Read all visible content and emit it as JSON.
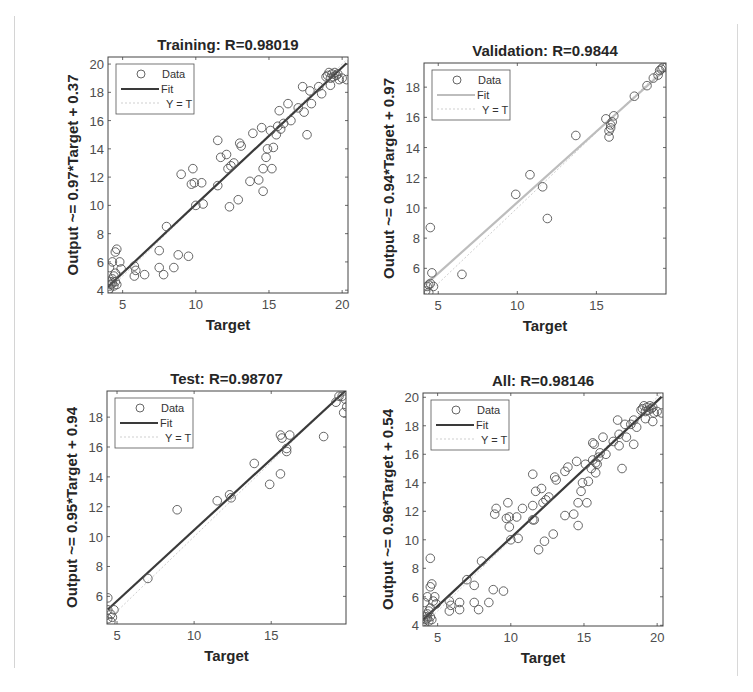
{
  "figure": {
    "legend": {
      "data_label": "Data",
      "fit_label": "Fit",
      "yt_label": "Y = T"
    },
    "colors": {
      "fit_dark": "#3a3a3a",
      "fit_light": "#bdbdbd",
      "yt": "#cfcfcf",
      "points": "#555555"
    }
  },
  "chart_data": [
    {
      "type": "scatter",
      "title": "Training: R=0.98019",
      "xlabel": "Target",
      "ylabel": "Output ~= 0.97*Target + 0.37",
      "xlim": [
        4,
        20.4
      ],
      "ylim": [
        3.8,
        20.5
      ],
      "xticks": [
        5,
        10,
        15,
        20
      ],
      "yticks": [
        4,
        6,
        8,
        10,
        12,
        14,
        16,
        18,
        20
      ],
      "fit": {
        "slope": 0.97,
        "intercept": 0.37,
        "color": "#3a3a3a"
      },
      "R": 0.98019,
      "points": [
        [
          4.1,
          4.1
        ],
        [
          4.2,
          4.4
        ],
        [
          4.3,
          4.5
        ],
        [
          4.4,
          4.3
        ],
        [
          4.5,
          4.6
        ],
        [
          4.3,
          4.8
        ],
        [
          4.4,
          5.0
        ],
        [
          4.5,
          5.2
        ],
        [
          4.2,
          4.6
        ],
        [
          4.6,
          4.4
        ],
        [
          4.1,
          5.6
        ],
        [
          4.3,
          6.0
        ],
        [
          4.5,
          6.7
        ],
        [
          4.6,
          6.9
        ],
        [
          4.8,
          6.0
        ],
        [
          4.9,
          5.5
        ],
        [
          4.0,
          3.9
        ],
        [
          5.8,
          5.7
        ],
        [
          5.8,
          5.0
        ],
        [
          5.9,
          5.4
        ],
        [
          6.5,
          5.1
        ],
        [
          7.5,
          6.8
        ],
        [
          7.5,
          5.6
        ],
        [
          7.8,
          5.1
        ],
        [
          8.0,
          8.5
        ],
        [
          8.5,
          5.6
        ],
        [
          8.8,
          6.5
        ],
        [
          9.0,
          12.2
        ],
        [
          9.5,
          6.4
        ],
        [
          9.7,
          11.5
        ],
        [
          9.8,
          12.6
        ],
        [
          9.9,
          11.6
        ],
        [
          10.0,
          10.0
        ],
        [
          10.4,
          11.6
        ],
        [
          10.5,
          10.1
        ],
        [
          11.5,
          11.4
        ],
        [
          11.5,
          14.6
        ],
        [
          11.7,
          13.4
        ],
        [
          12.1,
          13.6
        ],
        [
          12.2,
          12.6
        ],
        [
          12.3,
          9.9
        ],
        [
          12.4,
          12.8
        ],
        [
          12.6,
          13.0
        ],
        [
          12.9,
          10.4
        ],
        [
          13.0,
          14.4
        ],
        [
          13.1,
          14.2
        ],
        [
          13.7,
          11.7
        ],
        [
          13.9,
          15.1
        ],
        [
          14.3,
          11.8
        ],
        [
          14.5,
          15.5
        ],
        [
          14.6,
          12.6
        ],
        [
          14.6,
          11.0
        ],
        [
          14.8,
          13.4
        ],
        [
          14.9,
          14.0
        ],
        [
          15.1,
          15.3
        ],
        [
          15.2,
          12.6
        ],
        [
          15.3,
          14.1
        ],
        [
          15.5,
          15.0
        ],
        [
          15.6,
          15.6
        ],
        [
          15.7,
          16.7
        ],
        [
          15.8,
          15.4
        ],
        [
          16.0,
          15.8
        ],
        [
          16.3,
          17.2
        ],
        [
          16.5,
          16.0
        ],
        [
          17.0,
          16.9
        ],
        [
          17.3,
          18.4
        ],
        [
          17.4,
          16.6
        ],
        [
          17.6,
          15.0
        ],
        [
          17.8,
          18.1
        ],
        [
          17.9,
          17.2
        ],
        [
          18.4,
          18.4
        ],
        [
          18.6,
          17.9
        ],
        [
          18.9,
          19.1
        ],
        [
          19.0,
          19.2
        ],
        [
          19.1,
          19.4
        ],
        [
          19.2,
          19.0
        ],
        [
          19.3,
          19.3
        ],
        [
          19.4,
          19.1
        ],
        [
          19.5,
          19.4
        ],
        [
          19.6,
          19.2
        ],
        [
          19.7,
          19.3
        ],
        [
          19.8,
          18.9
        ],
        [
          20.0,
          19.0
        ],
        [
          20.3,
          18.9
        ],
        [
          19.2,
          18.5
        ]
      ]
    },
    {
      "type": "scatter",
      "title": "Validation: R=0.9844",
      "xlabel": "Target",
      "ylabel": "Output ~= 0.94*Target + 0.97",
      "xlim": [
        4.1,
        19.4
      ],
      "ylim": [
        4.3,
        19.6
      ],
      "xticks": [
        5,
        10,
        15
      ],
      "yticks": [
        6,
        8,
        10,
        12,
        14,
        16,
        18
      ],
      "fit": {
        "slope": 0.94,
        "intercept": 0.97,
        "color": "#bdbdbd"
      },
      "R": 0.9844,
      "points": [
        [
          4.2,
          4.5
        ],
        [
          4.3,
          4.8
        ],
        [
          4.4,
          4.9
        ],
        [
          4.5,
          5.0
        ],
        [
          4.4,
          4.4
        ],
        [
          4.7,
          4.8
        ],
        [
          4.6,
          5.7
        ],
        [
          4.5,
          8.7
        ],
        [
          6.5,
          5.6
        ],
        [
          9.9,
          10.9
        ],
        [
          10.8,
          12.2
        ],
        [
          11.6,
          11.4
        ],
        [
          11.9,
          9.3
        ],
        [
          13.7,
          14.8
        ],
        [
          15.6,
          15.9
        ],
        [
          15.8,
          14.7
        ],
        [
          15.8,
          15.1
        ],
        [
          15.9,
          15.3
        ],
        [
          15.9,
          15.5
        ],
        [
          16.0,
          15.7
        ],
        [
          16.1,
          16.1
        ],
        [
          17.4,
          17.4
        ],
        [
          18.2,
          18.1
        ],
        [
          18.6,
          18.6
        ],
        [
          18.9,
          18.8
        ],
        [
          19.0,
          19.1
        ],
        [
          19.1,
          19.2
        ],
        [
          19.2,
          19.3
        ],
        [
          19.4,
          19.3
        ]
      ]
    },
    {
      "type": "scatter",
      "title": "Test: R=0.98707",
      "xlabel": "Target",
      "ylabel": "Output ~= 0.95*Target + 0.94",
      "xlim": [
        4.35,
        19.85
      ],
      "ylim": [
        4.15,
        19.75
      ],
      "xticks": [
        5,
        10,
        15
      ],
      "yticks": [
        6,
        8,
        10,
        12,
        14,
        16,
        18
      ],
      "fit": {
        "slope": 0.95,
        "intercept": 0.94,
        "color": "#3a3a3a"
      },
      "R": 0.98707,
      "points": [
        [
          4.4,
          5.9
        ],
        [
          4.4,
          5.1
        ],
        [
          4.4,
          4.5
        ],
        [
          4.6,
          4.3
        ],
        [
          4.7,
          4.6
        ],
        [
          4.8,
          5.1
        ],
        [
          4.6,
          4.8
        ],
        [
          7.0,
          7.2
        ],
        [
          8.9,
          11.8
        ],
        [
          11.5,
          12.4
        ],
        [
          12.3,
          12.8
        ],
        [
          12.4,
          12.6
        ],
        [
          13.9,
          14.9
        ],
        [
          14.9,
          13.5
        ],
        [
          15.6,
          14.2
        ],
        [
          15.6,
          16.8
        ],
        [
          15.7,
          16.6
        ],
        [
          16.0,
          15.7
        ],
        [
          16.0,
          15.9
        ],
        [
          16.2,
          16.8
        ],
        [
          18.4,
          16.7
        ],
        [
          19.2,
          19.0
        ],
        [
          19.4,
          19.4
        ],
        [
          19.6,
          19.4
        ],
        [
          19.7,
          18.3
        ],
        [
          19.8,
          19.2
        ],
        [
          19.9,
          18.7
        ]
      ]
    },
    {
      "type": "scatter",
      "title": "All: R=0.98146",
      "xlabel": "Target",
      "ylabel": "Output ~= 0.96*Target + 0.54",
      "xlim": [
        4.0,
        20.4
      ],
      "ylim": [
        3.95,
        20.3
      ],
      "xticks": [
        5,
        10,
        15,
        20
      ],
      "yticks": [
        4,
        6,
        8,
        10,
        12,
        14,
        16,
        18,
        20
      ],
      "fit": {
        "slope": 0.96,
        "intercept": 0.54,
        "color": "#3a3a3a"
      },
      "R": 0.98146,
      "points": [
        [
          4.1,
          4.1
        ],
        [
          4.2,
          4.4
        ],
        [
          4.3,
          4.5
        ],
        [
          4.4,
          4.3
        ],
        [
          4.5,
          4.6
        ],
        [
          4.3,
          4.8
        ],
        [
          4.4,
          5.0
        ],
        [
          4.5,
          5.2
        ],
        [
          4.2,
          4.6
        ],
        [
          4.6,
          4.4
        ],
        [
          4.1,
          5.6
        ],
        [
          4.3,
          6.0
        ],
        [
          4.5,
          6.7
        ],
        [
          4.6,
          6.9
        ],
        [
          4.8,
          6.0
        ],
        [
          4.9,
          5.5
        ],
        [
          4.0,
          3.9
        ],
        [
          4.5,
          8.7
        ],
        [
          4.7,
          5.7
        ],
        [
          5.8,
          5.7
        ],
        [
          5.8,
          5.0
        ],
        [
          5.9,
          5.4
        ],
        [
          6.5,
          5.1
        ],
        [
          6.5,
          5.6
        ],
        [
          7.0,
          7.2
        ],
        [
          7.5,
          6.8
        ],
        [
          7.5,
          5.6
        ],
        [
          7.8,
          5.1
        ],
        [
          8.0,
          8.5
        ],
        [
          8.5,
          5.6
        ],
        [
          8.8,
          6.5
        ],
        [
          8.9,
          11.8
        ],
        [
          9.0,
          12.2
        ],
        [
          9.5,
          6.4
        ],
        [
          9.7,
          11.5
        ],
        [
          9.8,
          12.6
        ],
        [
          9.9,
          10.9
        ],
        [
          9.9,
          11.6
        ],
        [
          10.0,
          10.0
        ],
        [
          10.4,
          11.6
        ],
        [
          10.5,
          10.1
        ],
        [
          10.8,
          12.2
        ],
        [
          11.5,
          11.4
        ],
        [
          11.5,
          14.6
        ],
        [
          11.5,
          12.4
        ],
        [
          11.6,
          11.4
        ],
        [
          11.7,
          13.4
        ],
        [
          11.9,
          9.3
        ],
        [
          12.1,
          13.6
        ],
        [
          12.2,
          12.6
        ],
        [
          12.3,
          9.9
        ],
        [
          12.4,
          12.8
        ],
        [
          12.6,
          13.0
        ],
        [
          12.9,
          10.4
        ],
        [
          13.0,
          14.4
        ],
        [
          13.1,
          14.2
        ],
        [
          13.7,
          11.7
        ],
        [
          13.7,
          14.8
        ],
        [
          13.9,
          15.1
        ],
        [
          14.3,
          11.8
        ],
        [
          14.5,
          15.5
        ],
        [
          14.6,
          12.6
        ],
        [
          14.6,
          11.0
        ],
        [
          14.8,
          13.4
        ],
        [
          14.9,
          14.0
        ],
        [
          15.1,
          15.3
        ],
        [
          15.2,
          12.6
        ],
        [
          15.3,
          14.1
        ],
        [
          15.5,
          15.0
        ],
        [
          15.6,
          15.6
        ],
        [
          15.6,
          16.8
        ],
        [
          15.7,
          16.7
        ],
        [
          15.8,
          15.4
        ],
        [
          15.8,
          14.7
        ],
        [
          15.9,
          15.3
        ],
        [
          16.0,
          15.8
        ],
        [
          16.1,
          16.1
        ],
        [
          16.3,
          17.2
        ],
        [
          16.5,
          16.0
        ],
        [
          17.0,
          16.9
        ],
        [
          17.3,
          18.4
        ],
        [
          17.4,
          16.6
        ],
        [
          17.4,
          17.4
        ],
        [
          17.6,
          15.0
        ],
        [
          17.8,
          18.1
        ],
        [
          17.9,
          17.2
        ],
        [
          18.2,
          18.1
        ],
        [
          18.4,
          18.4
        ],
        [
          18.4,
          16.7
        ],
        [
          18.6,
          17.9
        ],
        [
          18.9,
          19.1
        ],
        [
          19.0,
          19.2
        ],
        [
          19.1,
          19.4
        ],
        [
          19.2,
          19.0
        ],
        [
          19.3,
          19.3
        ],
        [
          19.4,
          19.1
        ],
        [
          19.5,
          19.4
        ],
        [
          19.6,
          19.2
        ],
        [
          19.7,
          19.3
        ],
        [
          19.7,
          18.3
        ],
        [
          19.8,
          18.9
        ],
        [
          20.0,
          19.0
        ],
        [
          20.3,
          18.9
        ],
        [
          19.2,
          18.5
        ]
      ]
    }
  ]
}
